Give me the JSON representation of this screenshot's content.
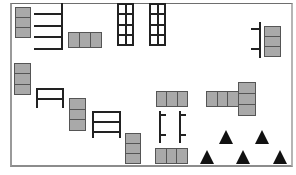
{
  "diagram": {
    "title": "",
    "kind": "floor-layout",
    "colors": {
      "block_fill": "#a9a9a9",
      "block_stroke": "#555555",
      "line": "#222222",
      "triangle": "#111111",
      "frame": "#8c8c8c"
    },
    "elements": {
      "gray_block_groups": [
        {
          "id": "stack-top-left",
          "orientation": "vertical",
          "cells": 3,
          "x": 15,
          "y": 7,
          "w": 16,
          "h": 30
        },
        {
          "id": "row-top-center",
          "orientation": "horizontal",
          "cells": 3,
          "x": 68,
          "y": 32,
          "w": 33,
          "h": 16
        },
        {
          "id": "stack-top-right",
          "orientation": "vertical",
          "cells": 3,
          "x": 264,
          "y": 26,
          "w": 17,
          "h": 30
        },
        {
          "id": "stack-left-mid",
          "orientation": "vertical",
          "cells": 3,
          "x": 14,
          "y": 63,
          "w": 17,
          "h": 31
        },
        {
          "id": "stack-mid-1",
          "orientation": "vertical",
          "cells": 3,
          "x": 69,
          "y": 98,
          "w": 17,
          "h": 32
        },
        {
          "id": "stack-mid-2",
          "orientation": "vertical",
          "cells": 3,
          "x": 125,
          "y": 133,
          "w": 16,
          "h": 30
        },
        {
          "id": "row-center-upper",
          "orientation": "horizontal",
          "cells": 3,
          "x": 156,
          "y": 91,
          "w": 31,
          "h": 16
        },
        {
          "id": "row-right-mid",
          "orientation": "horizontal",
          "cells": 3,
          "x": 206,
          "y": 91,
          "w": 32,
          "h": 16
        },
        {
          "id": "stack-right-mid",
          "orientation": "vertical",
          "cells": 3,
          "x": 238,
          "y": 82,
          "w": 18,
          "h": 33
        },
        {
          "id": "row-center-lower",
          "orientation": "horizontal",
          "cells": 3,
          "x": 155,
          "y": 148,
          "w": 32,
          "h": 16
        }
      ],
      "rack_grids": [
        {
          "id": "grid-1",
          "x": 117,
          "y": 3,
          "w": 17,
          "h": 43,
          "cols": 2,
          "rows": 4
        },
        {
          "id": "grid-2",
          "x": 149,
          "y": 3,
          "w": 17,
          "h": 43,
          "cols": 2,
          "rows": 4
        }
      ],
      "benches": [
        {
          "id": "shelf-comb-top-left",
          "type": "comb-right",
          "x": 34,
          "y": 3,
          "w": 29,
          "h": 45,
          "teeth": 4
        },
        {
          "id": "bench-left",
          "type": "double-bar",
          "x": 36,
          "y": 88,
          "w": 28,
          "h": 20,
          "bars": 2
        },
        {
          "id": "bench-mid",
          "type": "triple-bar",
          "x": 92,
          "y": 111,
          "w": 29,
          "h": 27,
          "bars": 3
        },
        {
          "id": "rail-top-right",
          "type": "rail-left-ticks",
          "x": 251,
          "y": 22,
          "w": 10,
          "h": 36
        },
        {
          "id": "rail-center-left",
          "type": "rail-right-ticks",
          "x": 159,
          "y": 111,
          "w": 7,
          "h": 32
        },
        {
          "id": "rail-center-right",
          "type": "rail-right-ticks",
          "x": 179,
          "y": 111,
          "w": 7,
          "h": 32
        }
      ],
      "triangles": [
        {
          "id": "tri-1",
          "x": 219,
          "y": 130
        },
        {
          "id": "tri-2",
          "x": 255,
          "y": 130
        },
        {
          "id": "tri-3",
          "x": 200,
          "y": 150
        },
        {
          "id": "tri-4",
          "x": 236,
          "y": 150
        },
        {
          "id": "tri-5",
          "x": 273,
          "y": 150
        }
      ]
    }
  }
}
